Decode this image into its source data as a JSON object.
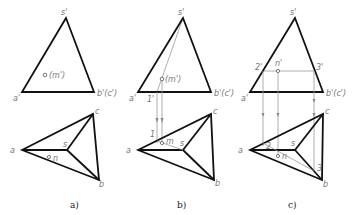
{
  "figure": {
    "panels": [
      {
        "id": "a",
        "caption": "a)",
        "front_view": {
          "apex_label": "s'",
          "left_label": "a'",
          "right_label": "b'(c')",
          "point_label": "(m')"
        },
        "top_view": {
          "labels": {
            "a": "a",
            "b": "b",
            "c": "c",
            "s": "s",
            "n": "n"
          }
        }
      },
      {
        "id": "b",
        "caption": "b)",
        "front_view": {
          "apex_label": "s'",
          "left_label": "a'",
          "right_label": "b'(c')",
          "point_label": "(m')",
          "aux_label": "1'"
        },
        "top_view": {
          "labels": {
            "a": "a",
            "b": "b",
            "c": "c",
            "s": "s",
            "m": "m",
            "one": "1"
          }
        }
      },
      {
        "id": "c",
        "caption": "c)",
        "front_view": {
          "apex_label": "s'",
          "left_label": "a'",
          "right_label": "b'(c')",
          "point_label": "n'",
          "aux_left": "2'",
          "aux_right": "3'"
        },
        "top_view": {
          "labels": {
            "a": "a",
            "b": "b",
            "c": "c",
            "s": "s",
            "n": "n",
            "two": "2",
            "three": "3"
          }
        }
      }
    ]
  }
}
